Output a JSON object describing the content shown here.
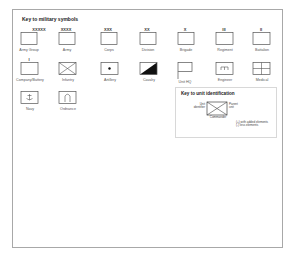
{
  "key": {
    "title": "Key to military symbols",
    "symbols": [
      {
        "id": "army-group",
        "label": "Army Group",
        "mark": "XXXXX"
      },
      {
        "id": "army",
        "label": "Army",
        "mark": "XXXX"
      },
      {
        "id": "corps",
        "label": "Corps",
        "mark": "XXX"
      },
      {
        "id": "division",
        "label": "Division",
        "mark": "XX"
      },
      {
        "id": "brigade",
        "label": "Brigade",
        "mark": "X"
      },
      {
        "id": "regiment",
        "label": "Regiment",
        "mark": "III"
      },
      {
        "id": "battalion",
        "label": "Battalion",
        "mark": "II"
      },
      {
        "id": "company-battery",
        "label": "Company/Battery",
        "mark": "I"
      },
      {
        "id": "infantry",
        "label": "Infantry",
        "mark": ""
      },
      {
        "id": "artillery",
        "label": "Artillery",
        "mark": ""
      },
      {
        "id": "cavalry",
        "label": "Cavalry",
        "mark": ""
      },
      {
        "id": "unit-hq",
        "label": "Unit HQ",
        "mark": ""
      },
      {
        "id": "engineer",
        "label": "Engineer",
        "mark": ""
      },
      {
        "id": "medical",
        "label": "Medical",
        "mark": ""
      },
      {
        "id": "navy",
        "label": "Navy",
        "mark": ""
      },
      {
        "id": "ordnance",
        "label": "Ordnance",
        "mark": ""
      }
    ]
  },
  "unit_id": {
    "title": "Key to unit identification",
    "left_label_1": "Unit",
    "left_label_2": "identifier",
    "right_label_1": "Parent",
    "right_label_2": "unit",
    "bottom_label": "Commander",
    "note_1": "(+) with added elements",
    "note_2": "(-) less elements"
  },
  "colors": {
    "line": "#555555",
    "frame": "#a8a8a8",
    "fill_dark": "#111111"
  }
}
